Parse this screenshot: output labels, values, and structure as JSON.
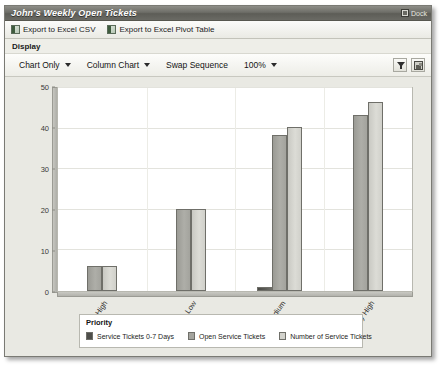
{
  "window": {
    "title": "John's Weekly Open Tickets",
    "dock_label": "Dock",
    "dock_icon": "dock-icon"
  },
  "export_bar": {
    "items": [
      {
        "label": "Export to Excel CSV",
        "icon": "excel-icon"
      },
      {
        "label": "Export to Excel Pivot Table",
        "icon": "excel-icon"
      }
    ]
  },
  "display": {
    "section_label": "Display",
    "controls": [
      {
        "label": "Chart Only",
        "has_caret": true
      },
      {
        "label": "Column Chart",
        "has_caret": true
      },
      {
        "label": "Swap Sequence",
        "has_caret": false
      },
      {
        "label": "100%",
        "has_caret": true
      }
    ],
    "tools": [
      {
        "icon": "filter-icon"
      },
      {
        "icon": "chart-properties-icon"
      }
    ]
  },
  "colors": {
    "titlebar": "#6e6e68",
    "panel_bg": "#e9e9e3",
    "plot_bg": "#ffffff",
    "series_0": "#4e4e4a",
    "series_1": "#a4a49e",
    "series_2": "#d2d2cc"
  },
  "chart_data": {
    "type": "bar",
    "title": "",
    "xlabel": "",
    "ylabel": "",
    "ylim": [
      0,
      50
    ],
    "yticks": [
      0,
      10,
      20,
      30,
      40,
      50
    ],
    "grid": true,
    "legend_position": "bottom",
    "legend_title": "Priority",
    "categories": [
      "High",
      "Low",
      "Medium",
      "Very High"
    ],
    "series": [
      {
        "name": "Service Tickets 0-7 Days",
        "values": [
          0,
          0,
          1,
          0
        ]
      },
      {
        "name": "Open Service Tickets",
        "values": [
          6,
          20,
          38,
          43
        ]
      },
      {
        "name": "Number of Service Tickets",
        "values": [
          6,
          20,
          40,
          46
        ]
      }
    ]
  }
}
